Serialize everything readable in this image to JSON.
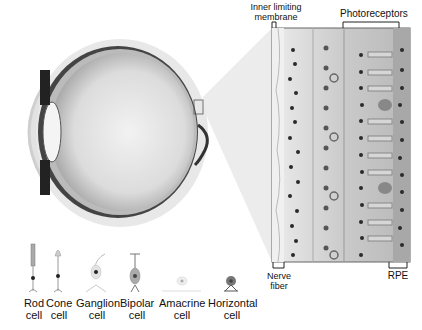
{
  "diagram": {
    "labels": {
      "inner_limiting_membrane": "Inner limiting membrane",
      "ilm_line1": "Inner limiting",
      "ilm_line2": "membrane",
      "photoreceptors": "Photoreceptors",
      "nerve_fiber_line1": "Nerve",
      "nerve_fiber_line2": "fiber",
      "rpe": "RPE"
    },
    "cell_types": [
      {
        "name": "rod",
        "line1": "Rod",
        "line2": "cell"
      },
      {
        "name": "cone",
        "line1": "Cone",
        "line2": "cell"
      },
      {
        "name": "ganglion",
        "line1": "Ganglion",
        "line2": "cell"
      },
      {
        "name": "bipolar",
        "line1": "Bipolar",
        "line2": "cell"
      },
      {
        "name": "amacrine",
        "line1": "Amacrine",
        "line2": "cell"
      },
      {
        "name": "horizontal",
        "line1": "Horizontal",
        "line2": "cell"
      }
    ],
    "colors": {
      "background": "#ffffff",
      "eye_fill": "#d9d9d9",
      "eye_dark": "#333333",
      "retina_light": "#e6e6e6",
      "retina_mid": "#bdbdbd",
      "nucleus": "#2a2a2a"
    }
  }
}
